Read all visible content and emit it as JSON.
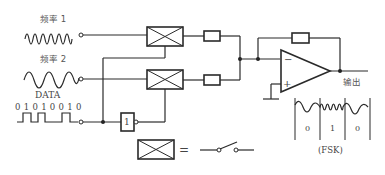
{
  "inputs": {
    "freq1_label": "频率 1",
    "freq2_label": "频率 2",
    "data_label": "DATA",
    "data_bits": "0 1 0 1 0 0 1 0"
  },
  "inverter": {
    "label": "1"
  },
  "output": {
    "label": "输出"
  },
  "opamp": {
    "minus": "−",
    "plus": "+"
  },
  "fsk": {
    "bits": [
      "0",
      "1",
      "0"
    ],
    "caption": "(FSK)"
  },
  "legend": {
    "equals": "="
  }
}
